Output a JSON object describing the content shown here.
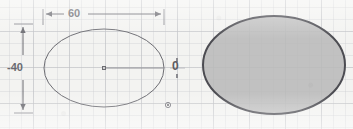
{
  "canvas": {
    "width": 353,
    "height": 129,
    "background_color": "#f3f3f1",
    "grid": {
      "visible": true,
      "minor_spacing_px": 12,
      "major_spacing_px": 36,
      "minor_color": "#cdcfd2",
      "major_color": "#bec0c4"
    }
  },
  "annotations": {
    "horizontal_dimension": {
      "name": "width-dimension",
      "value": "60",
      "orientation": "horizontal",
      "arrow_style": "outward-arrows-with-extension-lines",
      "color": "#6a6a70"
    },
    "vertical_dimension": {
      "name": "height-dimension",
      "value": "-40",
      "orientation": "vertical",
      "arrow_style": "outward-arrows-with-extension-lines",
      "color": "#6a6a70"
    },
    "zero_label": {
      "name": "angle-value-label",
      "value": "0",
      "color": "#5c5c62"
    }
  },
  "shapes": [
    {
      "name": "outline-ellipse",
      "type": "ellipse",
      "cx": 104,
      "cy": 68,
      "rx": 60,
      "ry": 39,
      "stroke_color": "#6d6d73",
      "fill": "none",
      "stroke_width": 1,
      "center_point_visible": true,
      "major_axis_line_visible": true
    },
    {
      "name": "filled-ellipse",
      "type": "ellipse",
      "cx": 274,
      "cy": 65,
      "rx": 71,
      "ry": 49,
      "stroke_color": "#4c4c52",
      "fill": "#b9b9b9",
      "stroke_width": 2,
      "center_point_visible": false,
      "major_axis_line_visible": false
    }
  ],
  "markers": [
    {
      "name": "ellipse-center-point",
      "x": 104,
      "y": 68,
      "color": "#6d6d73"
    },
    {
      "name": "construction-point",
      "x": 168,
      "y": 105,
      "color": "#6d6d73"
    }
  ],
  "grips": {
    "name": "quadrant-grip",
    "x": 177,
    "y": 68,
    "color": "#8a8a90"
  }
}
